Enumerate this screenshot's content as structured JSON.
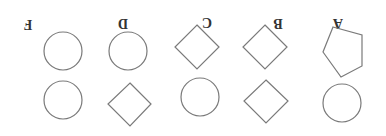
{
  "figure": {
    "orientation": "rotated-180",
    "columns": [
      {
        "label": "A",
        "top_shape": "pentagon",
        "bottom_shape": "circle"
      },
      {
        "label": "B",
        "top_shape": "diamond",
        "bottom_shape": "diamond"
      },
      {
        "label": "C",
        "top_shape": "diamond",
        "bottom_shape": "circle"
      },
      {
        "label": "D",
        "top_shape": "circle",
        "bottom_shape": "diamond"
      },
      {
        "label": "F",
        "top_shape": "circle",
        "bottom_shape": "circle"
      }
    ]
  }
}
